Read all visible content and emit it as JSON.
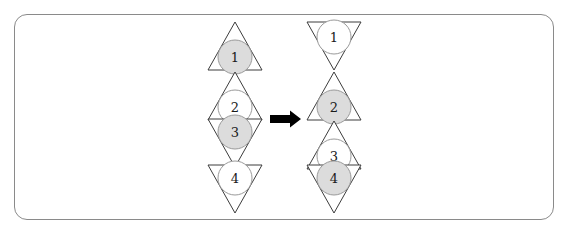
{
  "figure": {
    "canvas": {
      "width": 570,
      "height": 235,
      "background": "#ffffff"
    },
    "frame": {
      "name": "rounded-rectangle-border",
      "x": 14,
      "y": 14,
      "width": 540,
      "height": 206,
      "radius": 13,
      "stroke": "#8a8a8a",
      "stroke_width": 1
    },
    "colors": {
      "triangle_stroke": "#3c3c3c",
      "circle_stroke": "#9a9a9a",
      "circle_fill_shaded": "#dcdcdc",
      "circle_fill_empty": "#ffffff",
      "arrow": "#000000",
      "label_text": "#1a1a1a"
    },
    "geometry": {
      "triangle_half_width": 27,
      "triangle_height": 48,
      "circle_radius": 17
    }
  },
  "left_group": {
    "name": "before-configuration",
    "center_x": 235,
    "triangles": [
      {
        "label": "1",
        "orientation": "up",
        "apex_y": 22,
        "base_y": 70,
        "circle_cy": 57,
        "fill": "shaded"
      },
      {
        "label": "2",
        "orientation": "up",
        "apex_y": 72,
        "base_y": 120,
        "circle_cy": 107,
        "fill": "empty"
      },
      {
        "label": "3",
        "orientation": "down",
        "apex_y": 167,
        "base_y": 119,
        "circle_cy": 132,
        "fill": "shaded"
      },
      {
        "label": "4",
        "orientation": "down",
        "apex_y": 213,
        "base_y": 165,
        "circle_cy": 178,
        "fill": "empty"
      }
    ]
  },
  "arrow": {
    "name": "transformation-arrow",
    "direction": "right",
    "x_start": 270,
    "x_end": 301,
    "y": 119,
    "shaft_thickness": 8,
    "head_width": 11,
    "head_height": 17
  },
  "right_group": {
    "name": "after-configuration",
    "center_x": 334,
    "triangles": [
      {
        "label": "1",
        "orientation": "down",
        "apex_y": 70,
        "base_y": 22,
        "circle_cy": 37,
        "fill": "empty"
      },
      {
        "label": "2",
        "orientation": "up",
        "apex_y": 72,
        "base_y": 120,
        "circle_cy": 107,
        "fill": "shaded"
      },
      {
        "label": "3",
        "orientation": "up",
        "apex_y": 121,
        "base_y": 169,
        "circle_cy": 156,
        "fill": "empty"
      },
      {
        "label": "4",
        "orientation": "down",
        "apex_y": 213,
        "base_y": 165,
        "circle_cy": 178,
        "fill": "shaded"
      }
    ]
  }
}
